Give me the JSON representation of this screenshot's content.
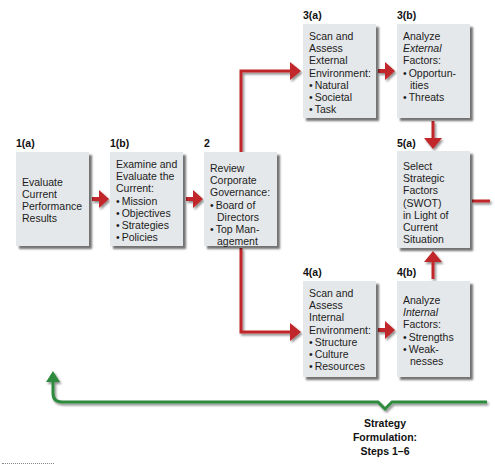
{
  "diagram": {
    "type": "flowchart",
    "colors": {
      "box_fill": "#e5e8ea",
      "arrow_red": "#c0282a",
      "bracket_green": "#2e8b3e",
      "text": "#1a1a1a"
    },
    "steps": {
      "s1a": {
        "label": "1(a)",
        "lines": [
          "Evaluate",
          "Current",
          "Performance",
          "Results"
        ]
      },
      "s1b": {
        "label": "1(b)",
        "lines": [
          "Examine and",
          "Evaluate the",
          "Current:"
        ],
        "bullets": [
          "Mission",
          "Objectives",
          "Strategies",
          "Policies"
        ]
      },
      "s2": {
        "label": "2",
        "lines": [
          "Review",
          "Corporate",
          "Governance:"
        ],
        "bullets": [
          "Board of",
          "Top Man-"
        ],
        "continuations": [
          "Directors",
          "agement"
        ]
      },
      "s3a": {
        "label": "3(a)",
        "lines": [
          "Scan and",
          "Assess",
          "External",
          "Environment:"
        ],
        "bullets": [
          "Natural",
          "Societal",
          "Task"
        ]
      },
      "s3b": {
        "label": "3(b)",
        "lines": [
          "Analyze",
          "External",
          "Factors:"
        ],
        "bullets": [
          "Opportun-",
          "Threats"
        ],
        "continuations": [
          "ities"
        ]
      },
      "s4a": {
        "label": "4(a)",
        "lines": [
          "Scan and",
          "Assess",
          "Internal",
          "Environment:"
        ],
        "bullets": [
          "Structure",
          "Culture",
          "Resources"
        ]
      },
      "s4b": {
        "label": "4(b)",
        "lines": [
          "Analyze",
          "Internal",
          "Factors:"
        ],
        "bullets": [
          "Strengths",
          "Weak-"
        ],
        "continuations": [
          "nesses"
        ]
      },
      "s5a": {
        "label": "5(a)",
        "lines": [
          "Select",
          "Strategic",
          "Factors",
          "(SWOT)",
          "in Light of",
          "Current",
          "Situation"
        ]
      }
    },
    "connections": [
      {
        "from": "1(a)",
        "to": "1(b)"
      },
      {
        "from": "1(b)",
        "to": "2"
      },
      {
        "from": "2",
        "to": "3(a)"
      },
      {
        "from": "2",
        "to": "4(a)"
      },
      {
        "from": "3(a)",
        "to": "3(b)"
      },
      {
        "from": "4(a)",
        "to": "4(b)"
      },
      {
        "from": "3(b)",
        "to": "5(a)"
      },
      {
        "from": "4(b)",
        "to": "5(a)"
      },
      {
        "from": "5(a)",
        "to": "off-page-right"
      }
    ],
    "caption": {
      "line1": "Strategy",
      "line2": "Formulation:",
      "line3": "Steps 1–6"
    }
  }
}
